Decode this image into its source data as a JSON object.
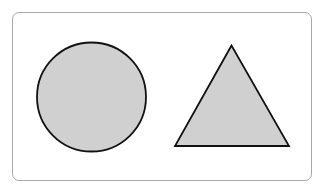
{
  "diagram": {
    "frame": {
      "border_color": "#a9a9a9",
      "background": "#ffffff"
    },
    "shapes": [
      {
        "type": "circle",
        "name": "circle",
        "cx": 91.5,
        "cy": 97,
        "r": 54.5,
        "fill": "#d0d0d0",
        "stroke": "#111111"
      },
      {
        "type": "triangle",
        "name": "triangle",
        "points": "231.5,45.5 175,146 289,146",
        "fill": "#d0d0d0",
        "stroke": "#111111"
      }
    ]
  }
}
